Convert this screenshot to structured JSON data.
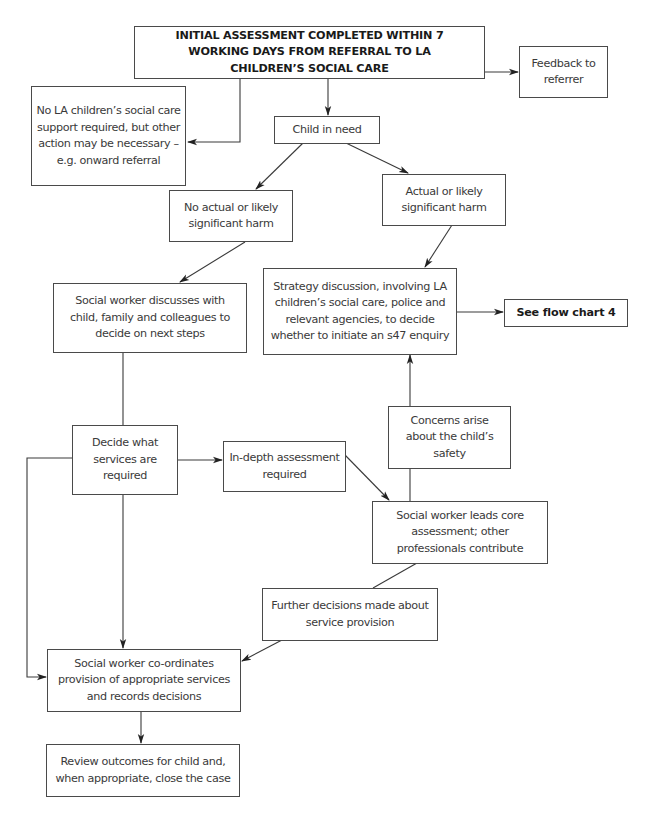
{
  "flowchart": {
    "nodes": {
      "initial_assessment": "INITIAL ASSESSMENT COMPLETED WITHIN 7 WORKING DAYS FROM REFERRAL TO LA CHILDREN’S SOCIAL CARE",
      "feedback": "Feedback to referrer",
      "no_la_support": "No LA children’s social care support required, but other action may be necessary – e.g. onward referral",
      "child_in_need": "Child in need",
      "no_harm": "No actual or likely significant harm",
      "actual_harm": "Actual or likely significant harm",
      "sw_discusses": "Social worker discusses with child, family and colleagues to decide on next steps",
      "strategy_discussion": "Strategy discussion, involving LA children’s social care, police and relevant agencies, to decide whether to initiate an s47 enquiry",
      "see_flow_chart_4": "See flow chart 4",
      "decide_services": "Decide what services are required",
      "in_depth": "In-depth assessment required",
      "concerns_arise": "Concerns arise about the child’s safety",
      "core_assessment": "Social worker leads core assessment; other professionals contribute",
      "further_decisions": "Further decisions made about service provision",
      "coordinates": "Social worker co-ordinates provision of appropriate services and records decisions",
      "review_outcomes": "Review outcomes for child and, when appropriate, close the case"
    },
    "colors": {
      "line": "#3a3a3a",
      "text": "#3a3a3a",
      "background": "#ffffff"
    }
  }
}
